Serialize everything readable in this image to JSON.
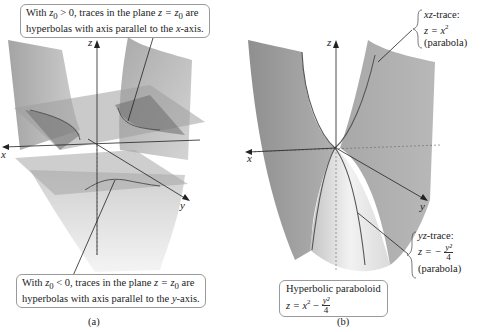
{
  "figure_a": {
    "caption": "(a)",
    "callout_top": {
      "line1_prefix": "With ",
      "line1_var": "z",
      "line1_sub": "0",
      "line1_mid": " > 0, traces in the plane ",
      "line1_eq": "z = z",
      "line1_eq_sub": "0",
      "line1_suffix": " are",
      "line2_prefix": "hyperbolas with axis parallel to the ",
      "line2_axis": "x",
      "line2_suffix": "-axis."
    },
    "callout_bottom": {
      "line1_prefix": "With ",
      "line1_var": "z",
      "line1_sub": "0",
      "line1_mid": " < 0, traces in the plane ",
      "line1_eq": "z = z",
      "line1_eq_sub": "0",
      "line1_suffix": " are",
      "line2_prefix": "hyperbolas with axis parallel to the ",
      "line2_axis": "y",
      "line2_suffix": "-axis."
    },
    "axes": {
      "x": "x",
      "y": "y",
      "z": "z"
    }
  },
  "figure_b": {
    "caption": "(b)",
    "axes": {
      "x": "x",
      "y": "y",
      "z": "z"
    },
    "xz_trace": {
      "title_var": "xz",
      "title_suffix": "-trace:",
      "equation_lhs": "z = x",
      "equation_exp": "2",
      "note": "(parabola)"
    },
    "yz_trace": {
      "title_var": "yz",
      "title_suffix": "-trace:",
      "equation_lhs": "z = −",
      "frac_num": "y²",
      "frac_den": "4",
      "note": "(parabola)"
    },
    "label_box": {
      "title": "Hyperbolic paraboloid",
      "equation_lhs": "z = x",
      "equation_exp": "2",
      "equation_minus": " − ",
      "frac_num": "y²",
      "frac_den": "4"
    }
  },
  "colors": {
    "surface_dark": "#8c8c8c",
    "surface_mid": "#b4b4b4",
    "surface_light": "#dcdcdc",
    "plane": "#a8a8a8",
    "axis": "#222222",
    "callout_border": "#9a9a9a"
  }
}
